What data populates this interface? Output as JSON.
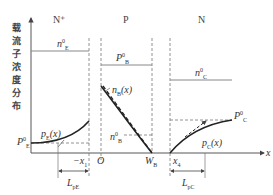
{
  "diagram": {
    "y_axis_label_chars": [
      "载",
      "流",
      "子",
      "浓",
      "度",
      "分",
      "布"
    ],
    "x_axis_label": "x",
    "regions": {
      "emitter": "N⁺",
      "base": "P",
      "collector": "N"
    },
    "labels": {
      "nE0": {
        "base": "n",
        "sup": "0",
        "sub": "E"
      },
      "PB0": {
        "base": "P",
        "sup": "0",
        "sub": "B"
      },
      "nC0": {
        "base": "n",
        "sup": "0",
        "sub": "C"
      },
      "PE0": {
        "base": "P",
        "sup": "0",
        "sub": "E"
      },
      "PC0": {
        "base": "P",
        "sup": "0",
        "sub": "C"
      },
      "nB_x": {
        "base": "n",
        "sub": "B",
        "tail": "(x)"
      },
      "nB0": {
        "base": "n",
        "sup": "0",
        "sub": "B"
      },
      "pE_x": {
        "base": "p",
        "sub": "E",
        "tail": "(x)"
      },
      "pC_x": {
        "base": "p",
        "sub": "C",
        "tail": "(x)"
      },
      "origin": "O",
      "WB": {
        "base": "W",
        "sub": "B"
      },
      "neg_x1": {
        "base": "−x",
        "sub": "1"
      },
      "x4": {
        "base": "x",
        "sub": "4"
      },
      "LpE": {
        "base": "L",
        "sub": "pE"
      },
      "LpC": {
        "base": "L",
        "sub": "pC"
      }
    },
    "colors": {
      "line": "#555555",
      "curve": "#222222",
      "dashed": "#777777"
    }
  }
}
